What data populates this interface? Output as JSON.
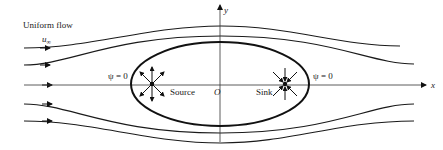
{
  "diagram": {
    "title_label": "Uniform flow",
    "freestream_label": "u",
    "freestream_subscript": "∞",
    "axis_x_label": "x",
    "axis_y_label": "y",
    "origin_label": "O",
    "source_label": "Source",
    "sink_label": "Sink",
    "psi_left_label": "ψ = 0",
    "psi_right_label": "ψ = 0"
  }
}
